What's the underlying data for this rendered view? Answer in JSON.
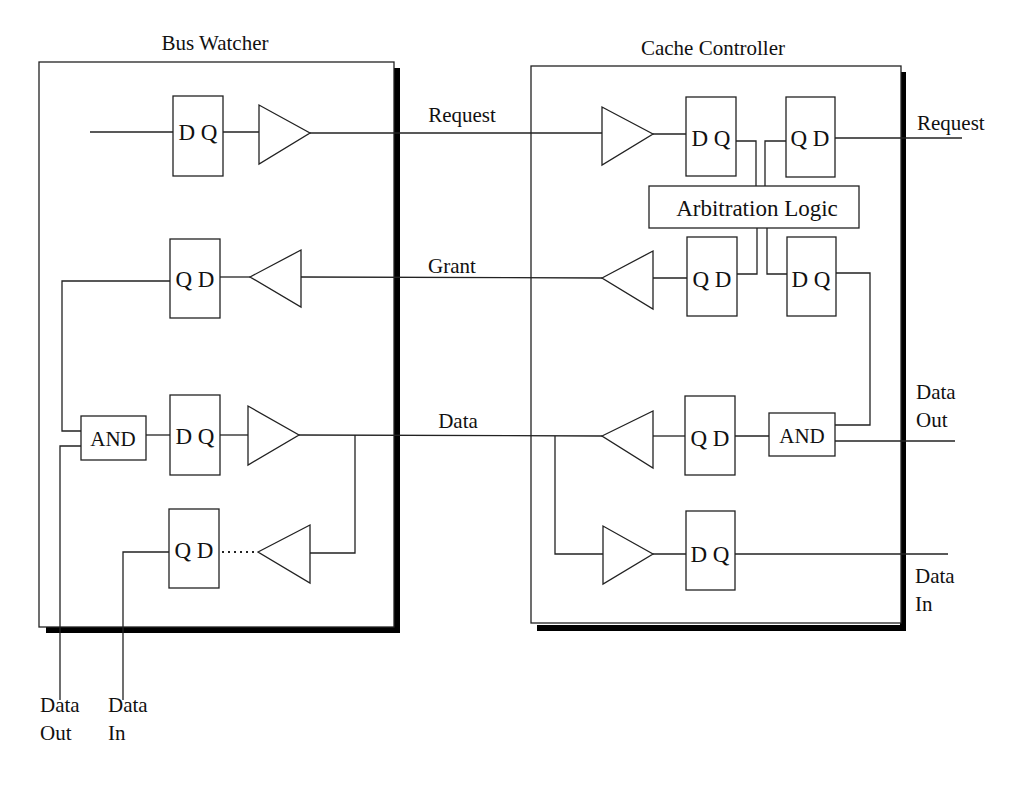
{
  "diagram": {
    "bus_watcher": {
      "title": "Bus Watcher",
      "request_ff": "D Q",
      "grant_ff": "Q D",
      "data_out_and": "AND",
      "data_out_ff": "D Q",
      "data_in_ff": "Q D",
      "external_data_out": [
        "Data",
        "Out"
      ],
      "external_data_in": [
        "Data",
        "In"
      ]
    },
    "cache_controller": {
      "title": "Cache Controller",
      "request_in_ff": "D Q",
      "request_out_ff": "Q D",
      "arbitration": "Arbitration Logic",
      "grant_out_ff": "Q D",
      "grant_in_ff": "D Q",
      "data_out_ff": "Q D",
      "data_and": "AND",
      "data_in_ff": "D Q",
      "external_request": "Request",
      "external_data_out": [
        "Data",
        "Out"
      ],
      "external_data_in": [
        "Data",
        "In"
      ]
    },
    "bus_signals": {
      "request": "Request",
      "grant": "Grant",
      "data": "Data"
    }
  }
}
